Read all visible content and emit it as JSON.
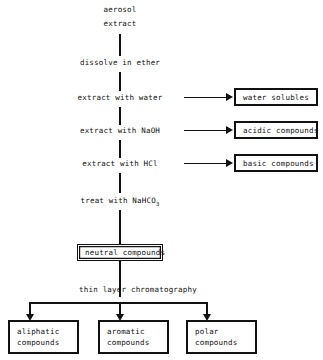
{
  "diagram": {
    "start": {
      "line1": "aerosol",
      "line2": "extract"
    },
    "steps": [
      {
        "id": "dissolve",
        "label": "dissolve in ether"
      },
      {
        "id": "extract-water",
        "label": "extract with water"
      },
      {
        "id": "extract-naoh",
        "label": "extract with NaOH"
      },
      {
        "id": "extract-hcl",
        "label": "extract with HCl"
      },
      {
        "id": "treat-nahco3",
        "label": "treat with NaHCO",
        "subscript": "3"
      },
      {
        "id": "tlc",
        "label": "thin layer chromatography"
      }
    ],
    "side_products": [
      {
        "id": "water-solubles",
        "label": "water solubles"
      },
      {
        "id": "acidic-compounds",
        "label": "acidic compounds"
      },
      {
        "id": "basic-compounds",
        "label": "basic compounds"
      }
    ],
    "intermediate": {
      "id": "neutral-compounds",
      "label": "neutral compounds"
    },
    "final_products": [
      {
        "id": "aliphatic",
        "line1": "aliphatic",
        "line2": "compounds"
      },
      {
        "id": "aromatic",
        "line1": "aromatic",
        "line2": "compounds"
      },
      {
        "id": "polar",
        "line1": "polar",
        "line2": "compounds"
      }
    ],
    "colors": {
      "line": "#111111",
      "text": "#0f0f0f",
      "background": "#ffffff"
    }
  }
}
